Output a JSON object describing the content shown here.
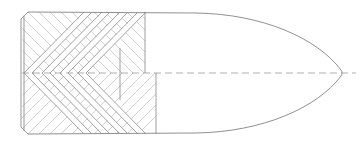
{
  "document": {
    "title": "Projectile Sectional View",
    "kind": "engineering-section-drawing",
    "width": 361,
    "height": 148,
    "background_color": "#ffffff"
  },
  "style": {
    "outline_color": "#8a8a8a",
    "hatch_color": "#b0b0b0",
    "centerline_color": "#9a9a9a",
    "detail_color": "#8f8f8f",
    "outline_width": 0.9,
    "hatch_width": 0.6,
    "centerline_width": 0.8,
    "centerline_dash": "7,4"
  },
  "geometry": {
    "axis_y": 73,
    "base_x": 21,
    "top_y": 12,
    "bottom_y": 134,
    "chamfer": 7,
    "hatch_end_top_x": 145,
    "hatch_end_bottom_x": 156,
    "inner_wall_x": 120,
    "inner_wall_top_y": 48,
    "inner_wall_bottom_y": 100,
    "ogive_start_x": 196,
    "tip_x": 343,
    "hatch_spacing": 11,
    "cavity_apex_x": 24
  },
  "features": [
    {
      "id": "base-face",
      "label": "Base face"
    },
    {
      "id": "base-chamfer-top",
      "label": "Top base chamfer"
    },
    {
      "id": "base-chamfer-bottom",
      "label": "Bottom base chamfer"
    },
    {
      "id": "section-hatch-upper",
      "label": "Upper section hatching"
    },
    {
      "id": "section-hatch-lower",
      "label": "Lower section hatching"
    },
    {
      "id": "chevron-cavity",
      "label": "Nested chevron cavity"
    },
    {
      "id": "inner-wall",
      "label": "Inner wall step"
    },
    {
      "id": "body-cylinder",
      "label": "Cylindrical body"
    },
    {
      "id": "ogive-nose",
      "label": "Ogive nose profile"
    },
    {
      "id": "centerline-axis",
      "label": "Axis centerline"
    }
  ],
  "chevrons": [
    {
      "index": 0,
      "apex_x": 24,
      "reach": 60
    },
    {
      "index": 1,
      "apex_x": 42,
      "reach": 52
    },
    {
      "index": 2,
      "apex_x": 60,
      "reach": 44
    },
    {
      "index": 3,
      "apex_x": 78,
      "reach": 36
    }
  ],
  "annotations": {
    "caption": "",
    "scale_note": "",
    "dimension_labels": []
  }
}
